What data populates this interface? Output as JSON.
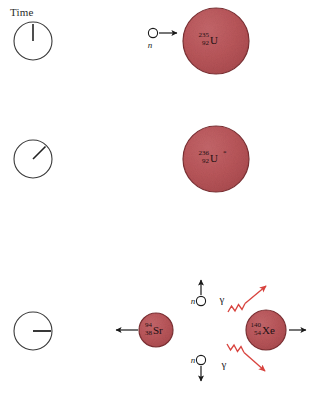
{
  "figure": {
    "time_axis_label": "Time",
    "background_color": "#ffffff",
    "nucleus_fill": "#b9565a",
    "nucleus_stroke": "#7d2f33",
    "gamma_color": "#d8433e",
    "arrow_color": "#1a1a1a",
    "clock_stroke": "#3a3a3a"
  },
  "stages": [
    {
      "name": "capture",
      "clock": {
        "hand_label": "12 o'clock",
        "hand_angle_deg": 0
      },
      "nucleus": {
        "mass_number": "235",
        "atomic_number": "92",
        "symbol": "U",
        "excited_marker": ""
      },
      "incoming_particle": {
        "label": "n",
        "direction": "right"
      }
    },
    {
      "name": "compound-nucleus",
      "clock": {
        "hand_label": "1:30 position",
        "hand_angle_deg": 45
      },
      "nucleus": {
        "mass_number": "236",
        "atomic_number": "92",
        "symbol": "U",
        "excited_marker": "*"
      }
    },
    {
      "name": "fission",
      "clock": {
        "hand_label": "3 o'clock",
        "hand_angle_deg": 90
      },
      "fragments": [
        {
          "mass_number": "94",
          "atomic_number": "38",
          "symbol": "Sr",
          "direction": "left"
        },
        {
          "mass_number": "140",
          "atomic_number": "54",
          "symbol": "Xe",
          "direction": "right"
        }
      ],
      "neutrons": [
        {
          "label": "n",
          "direction": "up"
        },
        {
          "label": "n",
          "direction": "down"
        }
      ],
      "gammas": [
        {
          "label": "γ",
          "direction": "up-right"
        },
        {
          "label": "γ",
          "direction": "down-right"
        }
      ]
    }
  ]
}
